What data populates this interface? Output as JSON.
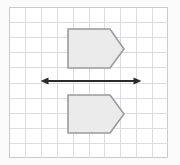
{
  "figure": {
    "background_color": "#fbfbfb",
    "grid": {
      "x": 9,
      "y": 7,
      "width": 159,
      "height": 151,
      "columns": 10,
      "rows": 10,
      "cell_width": 15.9,
      "cell_height": 15.1,
      "line_color": "#dcdce0",
      "frame_color": "#c9c9ce",
      "cell_fill": "#ffffff"
    },
    "shapes": [
      {
        "name": "upper-pentagon",
        "label": "Pre-image pentagon (above line)",
        "points": "68,29 110,29 124,49 110,68 68,68",
        "fill": "#ebebeb",
        "stroke": "#9a9a9f"
      },
      {
        "name": "lower-pentagon",
        "label": "Image pentagon (below line)",
        "points": "68,95 110,95 124,114 110,133 68,133",
        "fill": "#ebebeb",
        "stroke": "#9a9a9f"
      }
    ],
    "axis": {
      "name": "line-of-reflection",
      "label": "Double-headed arrow (line of reflection)",
      "x_start": 42,
      "x_end": 140,
      "y": 81,
      "color": "#2b2b2b",
      "arrowheads": "both"
    }
  }
}
